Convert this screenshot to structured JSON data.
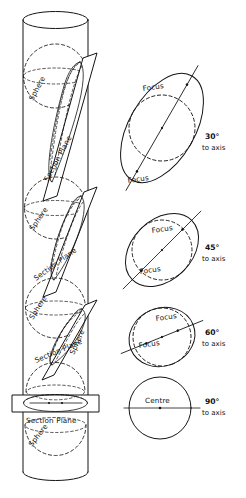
{
  "figure": {
    "background_color": "#ffffff",
    "ink_color": "#141414"
  },
  "cylinder": {
    "labels": {
      "sphere": "Sphere",
      "section_plane": "Section Plane"
    },
    "sphere_labels": [
      {
        "text": "Sphere",
        "x": 40,
        "y": 95,
        "rotate": -62
      },
      {
        "text": "Sphere",
        "x": 40,
        "y": 228,
        "rotate": -55
      },
      {
        "text": "Sphere",
        "x": 40,
        "y": 318,
        "rotate": -58
      },
      {
        "text": "Sphere",
        "x": 80,
        "y": 360,
        "rotate": -66
      },
      {
        "text": "Sphere",
        "x": 38,
        "y": 455,
        "rotate": -52
      }
    ],
    "section_plane_labels": [
      {
        "text": "Section Plane",
        "x": 50,
        "y": 178,
        "rotate": -62
      },
      {
        "text": "Section Plane",
        "x": 40,
        "y": 277,
        "rotate": -36
      },
      {
        "text": "Section Plane",
        "x": 40,
        "y": 360,
        "rotate": -23
      },
      {
        "text": "Section Plane",
        "x": 30,
        "y": 422,
        "rotate": 0
      }
    ]
  },
  "sections": [
    {
      "id": "section-30",
      "angle_label": "30°",
      "axis_label": "to axis",
      "focus_labels": [
        "Focus",
        "Focus"
      ],
      "shape": "ellipse",
      "has_centre": false
    },
    {
      "id": "section-45",
      "angle_label": "45°",
      "axis_label": "to axis",
      "focus_labels": [
        "Focus",
        "Focus"
      ],
      "shape": "ellipse",
      "has_centre": false
    },
    {
      "id": "section-60",
      "angle_label": "60°",
      "axis_label": "to axis",
      "focus_labels": [
        "Focus",
        "Focus"
      ],
      "shape": "ellipse",
      "has_centre": false
    },
    {
      "id": "section-90",
      "angle_label": "90°",
      "axis_label": "to axis",
      "focus_labels": [],
      "centre_label": "Centre",
      "shape": "circle",
      "has_centre": true
    }
  ]
}
